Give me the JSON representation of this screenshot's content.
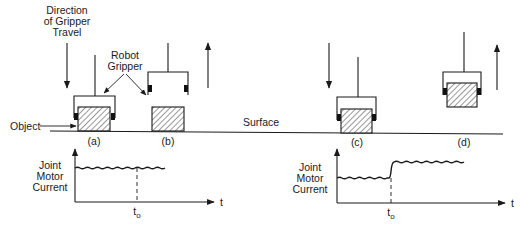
{
  "figure": {
    "direction_label": [
      "Direction",
      "of Gripper",
      "Travel"
    ],
    "gripper_label": [
      "Robot",
      "Gripper"
    ],
    "object_label": "Object",
    "surface_label": "Surface",
    "panels": [
      {
        "id": "a",
        "label": "(a)",
        "state": "gripper lowered, grasping object on surface",
        "arrow": "down"
      },
      {
        "id": "b",
        "label": "(b)",
        "state": "gripper raised, object left on surface",
        "arrow": "up"
      },
      {
        "id": "c",
        "label": "(c)",
        "state": "gripper lowered, grasping object on surface",
        "arrow": "down"
      },
      {
        "id": "d",
        "label": "(d)",
        "state": "gripper raised, lifting object",
        "arrow": "up"
      }
    ],
    "plots": [
      {
        "ylabel": [
          "Joint",
          "Motor",
          "Current"
        ],
        "xlabel": "t",
        "marker_label": "t",
        "marker_sub": "o",
        "behavior": "constant current before and after t0 (no object lifted)"
      },
      {
        "ylabel": [
          "Joint",
          "Motor",
          "Current"
        ],
        "xlabel": "t",
        "marker_label": "t",
        "marker_sub": "o",
        "behavior": "current steps up at t0 (object lifted)"
      }
    ]
  },
  "colors": {
    "ink": "#1a1a1a",
    "background": "#ffffff"
  }
}
